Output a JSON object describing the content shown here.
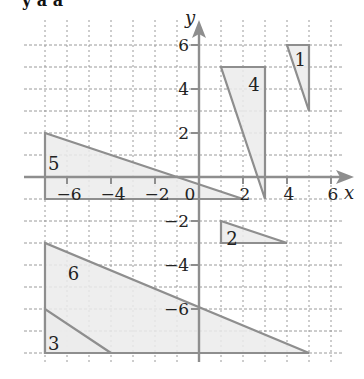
{
  "header": {
    "cutoff_text": "y  a  a"
  },
  "axes": {
    "x_label": "x",
    "y_label": "y",
    "x_ticks": [
      {
        "value": -6,
        "label": "−6"
      },
      {
        "value": -4,
        "label": "−4"
      },
      {
        "value": -2,
        "label": "−2"
      },
      {
        "value": 0,
        "label": "0"
      },
      {
        "value": 2,
        "label": "2"
      },
      {
        "value": 4,
        "label": "4"
      },
      {
        "value": 6,
        "label": "6"
      }
    ],
    "y_ticks": [
      {
        "value": 6,
        "label": "6"
      },
      {
        "value": 4,
        "label": "4"
      },
      {
        "value": 2,
        "label": "2"
      },
      {
        "value": -2,
        "label": "−2"
      },
      {
        "value": -4,
        "label": "−4"
      },
      {
        "value": -6,
        "label": "−6"
      }
    ],
    "xlim": [
      -7,
      7
    ],
    "ylim": [
      -8,
      6
    ],
    "grid": "dashed, 1 unit"
  },
  "colors": {
    "fill": "#ebebeb",
    "stroke": "#8e8e8e",
    "axis": "#8e8e8e",
    "grid": "#9a9a9a",
    "text": "#222222"
  },
  "shapes": [
    {
      "label": "1",
      "vertices": [
        [
          4,
          6
        ],
        [
          5,
          6
        ],
        [
          5,
          3
        ]
      ],
      "label_pos": [
        4.6,
        5.3
      ]
    },
    {
      "label": "4",
      "vertices": [
        [
          1,
          5
        ],
        [
          3,
          5
        ],
        [
          3,
          -1
        ]
      ],
      "label_pos": [
        2.5,
        4.2
      ]
    },
    {
      "label": "5",
      "vertices": [
        [
          -7,
          2
        ],
        [
          -7,
          -1
        ],
        [
          2,
          -1
        ]
      ],
      "label_pos": [
        -6.6,
        0.6
      ]
    },
    {
      "label": "2",
      "vertices": [
        [
          1,
          -2
        ],
        [
          1,
          -3
        ],
        [
          4,
          -3
        ]
      ],
      "label_pos": [
        1.5,
        -2.8
      ]
    },
    {
      "label": "6",
      "vertices": [
        [
          -7,
          -3
        ],
        [
          -7,
          -8
        ],
        [
          5,
          -8
        ]
      ],
      "label_pos": [
        -5.7,
        -4.4
      ]
    },
    {
      "label": "3",
      "vertices": [
        [
          -7,
          -6
        ],
        [
          -7,
          -8
        ],
        [
          -4,
          -8
        ]
      ],
      "label_pos": [
        -6.6,
        -7.6
      ]
    }
  ]
}
